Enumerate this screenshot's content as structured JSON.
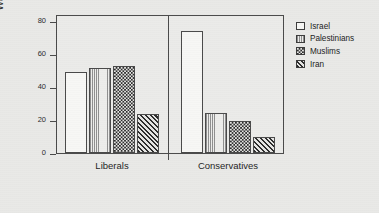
{
  "chart_data": {
    "type": "bar",
    "title": "",
    "xlabel": "",
    "ylabel": "Warmth",
    "ylim": [
      0,
      85
    ],
    "yticks": [
      0,
      20,
      40,
      60,
      80
    ],
    "ytick_labels": [
      "0",
      "20",
      "40",
      "60",
      "80"
    ],
    "grid": false,
    "legend_position": "right",
    "categories": [
      "Liberals",
      "Conservatives"
    ],
    "series": [
      {
        "name": "Israel",
        "values": [
          50,
          76
        ],
        "fill": "solid-white"
      },
      {
        "name": "Palestinians",
        "values": [
          53,
          25
        ],
        "fill": "vertical-light"
      },
      {
        "name": "Muslims",
        "values": [
          54,
          20
        ],
        "fill": "checker"
      },
      {
        "name": "Iran",
        "values": [
          24,
          10
        ],
        "fill": "diagonal"
      }
    ]
  },
  "axis": {
    "y_title": "Warmth",
    "y_tick_0": "0",
    "y_tick_1": "20",
    "y_tick_2": "40",
    "y_tick_3": "60",
    "y_tick_4": "80",
    "x_label_0": "Liberals",
    "x_label_1": "Conservatives"
  },
  "legend": {
    "items": [
      {
        "label": "Israel"
      },
      {
        "label": "Palestinians"
      },
      {
        "label": "Muslims"
      },
      {
        "label": "Iran"
      }
    ]
  },
  "colors": {
    "background": "#e9e9e7",
    "plot_background": "#ebebe9",
    "axis_line": "#4a4a4a",
    "bar_outline": "#4a4a4a",
    "hatch_dark": "#2d2d2d",
    "bar_white": "#f7f7f5",
    "text": "#1f1f1f"
  }
}
